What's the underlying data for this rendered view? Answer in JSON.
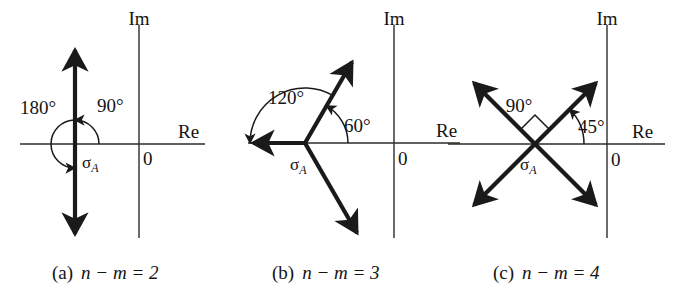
{
  "figure": {
    "axis_labels": {
      "real": "Re",
      "imag": "Im",
      "origin": "0",
      "centroid": "σ",
      "centroid_sub": "A"
    },
    "panels": [
      {
        "id": "a",
        "caption_index": "(a)",
        "caption_expr": "n − m = 2",
        "n_minus_m": 2,
        "angle_labels": [
          "180°",
          "90°"
        ],
        "asymptote_angles_deg": [
          90,
          270
        ],
        "arc_annotations": [
          {
            "label": "90°",
            "from_deg": 0,
            "to_deg": 90
          },
          {
            "label": "180°",
            "from_deg": 0,
            "to_deg": 270
          }
        ]
      },
      {
        "id": "b",
        "caption_index": "(b)",
        "caption_expr": "n − m = 3",
        "n_minus_m": 3,
        "angle_labels": [
          "120°",
          "60°"
        ],
        "asymptote_angles_deg": [
          60,
          180,
          300
        ],
        "arc_annotations": [
          {
            "label": "60°",
            "from_deg": 0,
            "to_deg": 60
          },
          {
            "label": "120°",
            "from_deg": 0,
            "to_deg": 180
          }
        ]
      },
      {
        "id": "c",
        "caption_index": "(c)",
        "caption_expr": "n − m = 4",
        "n_minus_m": 4,
        "angle_labels": [
          "90°",
          "45°"
        ],
        "asymptote_angles_deg": [
          45,
          135,
          225,
          315
        ],
        "arc_annotations": [
          {
            "label": "45°",
            "from_deg": 0,
            "to_deg": 45
          },
          {
            "label": "90°",
            "from_deg": 45,
            "to_deg": 135
          }
        ]
      }
    ],
    "colors": {
      "background": "#ffffff",
      "ink": "#1a1a1a",
      "axis": "#2b2b2b"
    }
  }
}
